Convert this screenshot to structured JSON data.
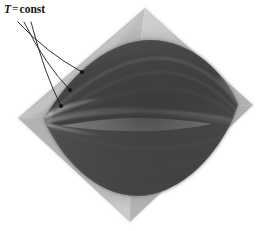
{
  "figure": {
    "background_color": "#ffffff",
    "width": 267,
    "height": 231
  },
  "annotation": {
    "symbol": "T",
    "equals": "=",
    "value": "const",
    "full_text": "T = const",
    "text_color": "#151515",
    "leader_line_color": "#1a1a1a",
    "leader_count": 3,
    "leaders": [
      {
        "name": "leader-1",
        "x1": 18,
        "y1": 22,
        "x2": 82,
        "y2": 72
      },
      {
        "name": "leader-2",
        "x1": 24,
        "y1": 22,
        "x2": 70,
        "y2": 90
      },
      {
        "name": "leader-3",
        "x1": 31,
        "y1": 22,
        "x2": 61,
        "y2": 106
      }
    ]
  },
  "chart_data": {
    "type": "surface",
    "subtitle": "",
    "xlabel": "",
    "ylabel": "",
    "legend": [],
    "grid": false,
    "colorspace": "grayscale",
    "annotations": [
      {
        "text": "T = const",
        "x": 4,
        "y": 4,
        "points_to": "isotherm curves on surface"
      }
    ],
    "geometry": {
      "outer_diamond": {
        "name": "base-plane",
        "vertices": [
          {
            "label": "top",
            "x": 145,
            "y": 8
          },
          {
            "label": "right",
            "x": 253,
            "y": 105
          },
          {
            "label": "bottom",
            "x": 130,
            "y": 222
          },
          {
            "label": "left",
            "x": 18,
            "y": 118
          }
        ],
        "fill_light": "#c6c6c6",
        "fill_mid": "#b0b0b0",
        "fill_shadow": "#9a9a9a"
      },
      "inner_lens": {
        "name": "thermodynamic-surface",
        "left_point": {
          "x": 44,
          "y": 119
        },
        "right_point": {
          "x": 238,
          "y": 104
        },
        "top_apex": {
          "x": 150,
          "y": 40
        },
        "bottom_apex": {
          "x": 137,
          "y": 196
        },
        "fill_dark": "#4a4a4a",
        "fill_darker": "#3a3a3a",
        "fill_mid": "#5e5e5e"
      },
      "isotherms": [
        {
          "name": "isotherm-upper-1",
          "shade": "#6b6b6b"
        },
        {
          "name": "isotherm-upper-2",
          "shade": "#7a7a7a"
        },
        {
          "name": "isotherm-ridge",
          "shade": "#666666"
        },
        {
          "name": "isotherm-lower-1",
          "shade": "#5a5a5a"
        },
        {
          "name": "isotherm-lower-2",
          "shade": "#505050"
        }
      ]
    },
    "palette": {
      "white": "#ffffff",
      "base_light": "#c6c6c6",
      "base_mid": "#b0b0b0",
      "base_shadow": "#9a9a9a",
      "surface_dark": "#4a4a4a",
      "surface_darker": "#3a3a3a",
      "surface_mid": "#5e5e5e",
      "ink": "#151515"
    }
  }
}
